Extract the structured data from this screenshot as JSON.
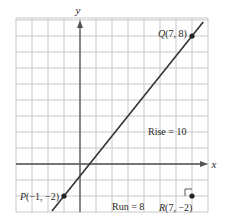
{
  "chart_data": {
    "type": "line",
    "title": "",
    "xlabel": "x",
    "ylabel": "y",
    "xlim": [
      -4,
      8
    ],
    "ylim": [
      -3,
      9
    ],
    "grid": true,
    "grid_step": 1,
    "series": [
      {
        "name": "line through P and Q",
        "x": [
          -1,
          7
        ],
        "y": [
          -2,
          8
        ],
        "extends_beyond_points": true
      }
    ],
    "points": [
      {
        "id": "P",
        "label": "P(−1, −2)",
        "x": -1,
        "y": -2
      },
      {
        "id": "Q",
        "label": "Q(7, 8)",
        "x": 7,
        "y": 8
      },
      {
        "id": "R",
        "label": "R(7, −2)",
        "x": 7,
        "y": -2
      }
    ],
    "annotations": [
      {
        "text": "Rise = 10",
        "x": 5.4,
        "y": 3
      },
      {
        "text": "Run = 8",
        "x": 3.6,
        "y": -2.6
      }
    ],
    "right_angle_at": "R",
    "slope": 1.25
  },
  "labels": {
    "x_axis": "x",
    "y_axis": "y",
    "P_letter": "P",
    "P_coords": "(−1, −2)",
    "Q_letter": "Q",
    "Q_coords": "(7, 8)",
    "R_letter": "R",
    "R_coords": "(7, −2)",
    "rise": "Rise = 10",
    "run": "Run = 8"
  },
  "colors": {
    "grid": "#c8c8c8",
    "axis": "#555555",
    "line": "#333333",
    "point": "#222222",
    "border": "#bdbdbd"
  }
}
